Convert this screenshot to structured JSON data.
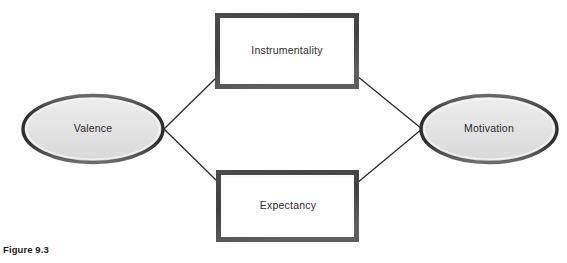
{
  "figure": {
    "caption": "Figure 9.3",
    "background_color": "#ffffff"
  },
  "diagram": {
    "type": "flow-diagram",
    "nodes": [
      {
        "id": "valence",
        "label": "Valence",
        "shape": "ellipse",
        "cx": 93,
        "cy": 129,
        "rx": 71,
        "ry": 34,
        "fill": "#e2e2e2",
        "stroke": "#3a3a3a"
      },
      {
        "id": "instrumentality",
        "label": "Instrumentality",
        "shape": "rectangle",
        "x": 216,
        "y": 14,
        "width": 142,
        "height": 74,
        "fill": "#ffffff",
        "stroke": "#3a3a3a"
      },
      {
        "id": "expectancy",
        "label": "Expectancy",
        "shape": "rectangle",
        "x": 217,
        "y": 171,
        "width": 141,
        "height": 70,
        "fill": "#ffffff",
        "stroke": "#3a3a3a"
      },
      {
        "id": "motivation",
        "label": "Motivation",
        "shape": "ellipse",
        "cx": 489,
        "cy": 129,
        "rx": 69,
        "ry": 34,
        "fill": "#e2e2e2",
        "stroke": "#3a3a3a"
      }
    ],
    "connectors": [
      {
        "id": "valence-to-instrumentality",
        "from": "valence",
        "to": "instrumentality",
        "x1": 164,
        "y1": 129,
        "x2": 216,
        "y2": 77
      },
      {
        "id": "valence-to-expectancy",
        "from": "valence",
        "to": "expectancy",
        "x1": 164,
        "y1": 129,
        "x2": 217,
        "y2": 182
      },
      {
        "id": "instrumentality-to-motivation",
        "from": "instrumentality",
        "to": "motivation",
        "x1": 358,
        "y1": 77,
        "x2": 421,
        "y2": 129
      },
      {
        "id": "expectancy-to-motivation",
        "from": "expectancy",
        "to": "motivation",
        "x1": 358,
        "y1": 182,
        "x2": 421,
        "y2": 129
      }
    ],
    "line_color": "#2a2a2a"
  }
}
